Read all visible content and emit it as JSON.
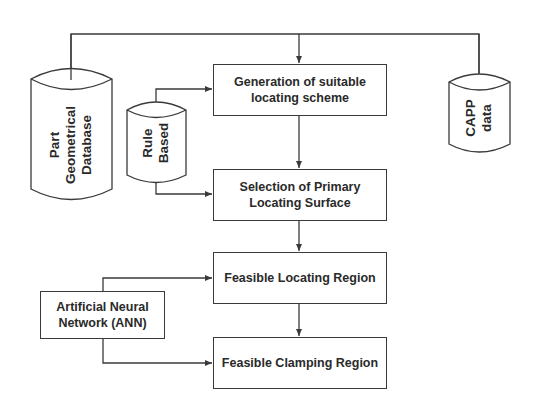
{
  "diagram": {
    "type": "flowchart",
    "colors": {
      "stroke": "#3a3a3a",
      "text": "#2a2a2a",
      "background": "#ffffff"
    },
    "databases": {
      "part_geometrical": {
        "lines": [
          "Part",
          "Geometrical",
          "Database"
        ]
      },
      "rule_based": {
        "lines": [
          "Rule",
          "Based"
        ]
      },
      "capp": {
        "lines": [
          "CAPP",
          "data"
        ]
      }
    },
    "process_boxes": {
      "generation": {
        "line1": "Generation of suitable",
        "line2": "locating scheme"
      },
      "selection": {
        "line1": "Selection of Primary",
        "line2": "Locating Surface"
      },
      "feasible_locating": {
        "label": "Feasible Locating Region"
      },
      "feasible_clamping": {
        "label": "Feasible Clamping Region"
      }
    },
    "ann_box": {
      "line1": "Artificial Neural",
      "line2": "Network (ANN)"
    },
    "edges": [
      {
        "from": "Part Geometrical Database",
        "to": "Generation of suitable locating scheme"
      },
      {
        "from": "CAPP data",
        "to": "Generation of suitable locating scheme"
      },
      {
        "from": "Rule Based",
        "to": "Generation of suitable locating scheme"
      },
      {
        "from": "Rule Based",
        "to": "Selection of Primary Locating Surface"
      },
      {
        "from": "Generation of suitable locating scheme",
        "to": "Selection of Primary Locating Surface"
      },
      {
        "from": "Selection of Primary Locating Surface",
        "to": "Feasible Locating Region"
      },
      {
        "from": "Feasible Locating Region",
        "to": "Feasible Clamping Region"
      },
      {
        "from": "Artificial Neural Network (ANN)",
        "to": "Feasible Locating Region"
      },
      {
        "from": "Artificial Neural Network (ANN)",
        "to": "Feasible Clamping Region"
      }
    ]
  }
}
